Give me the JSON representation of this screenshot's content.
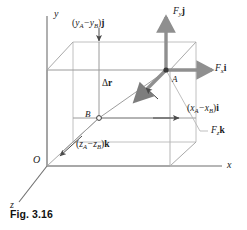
{
  "figure": {
    "caption": "Fig. 3.16",
    "axes": {
      "y_label": "y",
      "x_label": "x",
      "z_label": "z",
      "origin_label": "O"
    },
    "points": {
      "a_label": "A",
      "b_label": "B"
    },
    "vectors": {
      "displacement": {
        "delta": "Δ",
        "symbol": "r"
      },
      "force_y": {
        "component": "F",
        "subscript": "y",
        "unit": "j"
      },
      "force_x": {
        "component": "F",
        "subscript": "x",
        "unit": "i"
      },
      "force_z": {
        "component": "F",
        "subscript": "z",
        "unit": "k"
      }
    },
    "components": {
      "y_component": {
        "open": "(",
        "first": "y",
        "first_sub": "A",
        "minus": "−",
        "second": "y",
        "second_sub": "B",
        "close": ")",
        "unit": "j"
      },
      "x_component": {
        "open": "(",
        "first": "x",
        "first_sub": "A",
        "minus": "−",
        "second": "x",
        "second_sub": "B",
        "close": ")",
        "unit": "i"
      },
      "z_component": {
        "open": "(",
        "first": "z",
        "first_sub": "A",
        "minus": "−",
        "second": "z",
        "second_sub": "B",
        "close": ")",
        "unit": "k"
      }
    },
    "colors": {
      "axis": "#6b6b6b",
      "box_front": "#8c8c8c",
      "box_back": "#b8b8b8",
      "force_vector": "#8a8a8a",
      "thin_arrow": "#555555",
      "text": "#1a1a1a"
    }
  }
}
